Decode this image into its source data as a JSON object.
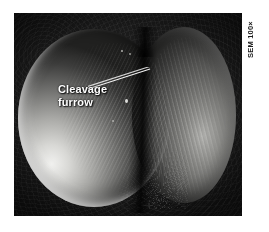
{
  "figure": {
    "type": "scanning-electron-micrograph",
    "annotation": {
      "label_line_1": "Cleavage",
      "label_line_2": "furrow",
      "leader_icon": "leader-line-icon"
    },
    "caption": {
      "magnification": "SEM 100×"
    },
    "colors": {
      "page_background": "#ffffff",
      "plate_background": "#101010",
      "label_text": "#ffffff",
      "caption_text": "#1a1a1a",
      "cell_highlight": "#f2f2f0",
      "cell_shadow": "#1d1d1c"
    },
    "plate": {
      "left": 14,
      "top": 13,
      "width": 228,
      "height": 203
    }
  }
}
